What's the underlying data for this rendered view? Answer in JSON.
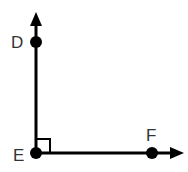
{
  "diagram": {
    "points": {
      "D": {
        "label": "D",
        "x": 36,
        "y": 42
      },
      "E": {
        "label": "E",
        "x": 36,
        "y": 153
      },
      "F": {
        "label": "F",
        "x": 152,
        "y": 153
      }
    },
    "rays": [
      {
        "from": "E",
        "through": "D",
        "direction": "up"
      },
      {
        "from": "E",
        "through": "F",
        "direction": "right"
      }
    ],
    "right_angle_at": "E",
    "colors": {
      "stroke": "#000000",
      "label": "#333333"
    }
  }
}
